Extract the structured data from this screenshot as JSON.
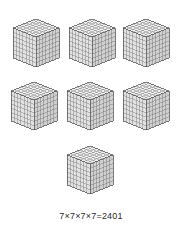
{
  "figure": {
    "type": "math-illustration",
    "caption": "7×7×7×7=2401",
    "background_color": "#ffffff",
    "line_color": "#555555",
    "face_colors": {
      "top": "#f2f2f2",
      "left": "#e2e2e2",
      "right": "#d0d0d0"
    },
    "cube": {
      "divisions": 7,
      "unit_cubes_per_cube": 343,
      "label": "7×7×7 cube"
    },
    "cube_count": 7,
    "rows": [
      {
        "row_label": "top-row",
        "cubes": [
          {
            "name": "cube-1",
            "x": 12,
            "y": 16
          },
          {
            "name": "cube-2",
            "x": 68,
            "y": 16
          },
          {
            "name": "cube-3",
            "x": 122,
            "y": 16
          }
        ]
      },
      {
        "row_label": "middle-row",
        "cubes": [
          {
            "name": "cube-4",
            "x": 10,
            "y": 79
          },
          {
            "name": "cube-5",
            "x": 66,
            "y": 79
          },
          {
            "name": "cube-6",
            "x": 122,
            "y": 79
          }
        ]
      },
      {
        "row_label": "bottom-row",
        "cubes": [
          {
            "name": "cube-7",
            "x": 66,
            "y": 143
          }
        ]
      }
    ]
  },
  "chart_data": {
    "type": "table",
    "title": "7×7×7×7=2401",
    "categories": [
      "cube-1",
      "cube-2",
      "cube-3",
      "cube-4",
      "cube-5",
      "cube-6",
      "cube-7"
    ],
    "values": [
      343,
      343,
      343,
      343,
      343,
      343,
      343
    ],
    "xlabel": "",
    "ylabel": "unit cubes",
    "annotations": [
      "7×7×7×7=2401"
    ]
  }
}
